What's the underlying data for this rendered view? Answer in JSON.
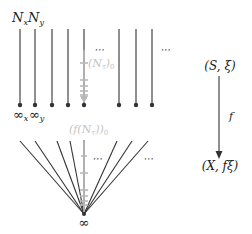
{
  "diagram": {
    "labels": {
      "top_left": "NₓNᵧ",
      "nx": "N",
      "nx_sub": "x",
      "ny": "N",
      "ny_sub": "y",
      "inf_x": "∞",
      "inf_x_sub": "x",
      "inf_y": "∞",
      "inf_y_sub": "y",
      "stalk_label": "(Nₗ)₀",
      "stalk_label_main": "(N",
      "stalk_label_sub": "τ",
      "stalk_label_tail": ")",
      "stalk_label_tail_sub": "0",
      "pushforward_label_main": "(f(N",
      "pushforward_label_sub": "τ",
      "pushforward_label_tail": "))",
      "pushforward_label_tail_sub": "0",
      "ellipsis": "⋯",
      "fan_point": "∞",
      "source": "(S, ξ)",
      "target": "(X, fξ)",
      "map": "f"
    },
    "parallel_lines_x": [
      20,
      35,
      52,
      68,
      84,
      119,
      136,
      152
    ],
    "fan_tops_x": [
      20,
      35,
      57,
      70,
      84,
      117,
      132,
      148
    ],
    "colors": {
      "line": "#333333",
      "accent_gray": "#b8b8b8",
      "text": "#222222"
    }
  }
}
